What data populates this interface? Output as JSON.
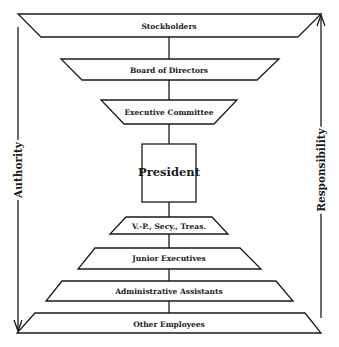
{
  "diagram": {
    "type": "organization-hierarchy",
    "levels": [
      {
        "label": "Stockholders",
        "shape": "inverted-trapezoid"
      },
      {
        "label": "Board of Directors",
        "shape": "inverted-trapezoid"
      },
      {
        "label": "Executive Committee",
        "shape": "inverted-trapezoid"
      },
      {
        "label": "President",
        "shape": "rectangle"
      },
      {
        "label": "V.-P., Secy., Treas.",
        "shape": "trapezoid"
      },
      {
        "label": "Junior Executives",
        "shape": "trapezoid"
      },
      {
        "label": "Administrative Assistants",
        "shape": "trapezoid"
      },
      {
        "label": "Other Employees",
        "shape": "trapezoid"
      }
    ],
    "left_arrow": {
      "label": "Authority",
      "direction": "down"
    },
    "right_arrow": {
      "label": "Responsibility",
      "direction": "up"
    },
    "colors": {
      "ink": "#1a1a1a",
      "background": "#ffffff"
    }
  }
}
